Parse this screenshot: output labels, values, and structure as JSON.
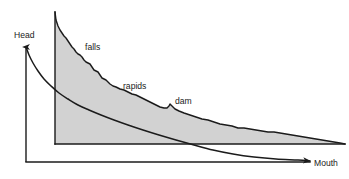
{
  "figure": {
    "kind": "river-longitudinal-profile-diagram",
    "background_color": "#ffffff",
    "stroke_color": "#1b1b1b",
    "fill_color": "#d2d2d2"
  },
  "axes": {
    "head_label": "Head",
    "mouth_label": "Mouth",
    "vertical_axis_name": "elevation-axis",
    "horizontal_axis_name": "distance-axis"
  },
  "annotations": [
    {
      "id": "falls",
      "label": "falls"
    },
    {
      "id": "rapids",
      "label": "rapids"
    },
    {
      "id": "dam",
      "label": "dam"
    }
  ],
  "chart_data": {
    "type": "area",
    "title": "",
    "subtitle": "",
    "xlabel": "Mouth",
    "ylabel": "Head",
    "grid": false,
    "legend": "none",
    "xlim": [
      0,
      349
    ],
    "ylim": [
      0,
      179
    ],
    "axis_note": "Pixel coordinate space of the original 349x179 raster; y increases downward.",
    "series": [
      {
        "name": "irregular river profile (actual long profile with falls, rapids and dam)",
        "type": "area",
        "fill": "#d2d2d2",
        "stroke": "#1b1b1b",
        "baseline_y": 144,
        "points": [
          [
            55,
            12
          ],
          [
            56,
            20
          ],
          [
            58,
            26
          ],
          [
            60,
            30
          ],
          [
            62,
            33
          ],
          [
            64,
            36
          ],
          [
            66,
            38
          ],
          [
            68,
            41
          ],
          [
            70,
            44
          ],
          [
            72,
            47
          ],
          [
            74,
            49
          ],
          [
            76,
            52
          ],
          [
            78,
            54
          ],
          [
            80,
            55
          ],
          [
            82,
            57
          ],
          [
            84,
            60
          ],
          [
            86,
            62
          ],
          [
            88,
            63
          ],
          [
            90,
            64
          ],
          [
            92,
            67
          ],
          [
            94,
            70
          ],
          [
            96,
            71
          ],
          [
            98,
            72
          ],
          [
            100,
            75
          ],
          [
            102,
            78
          ],
          [
            104,
            79
          ],
          [
            106,
            80
          ],
          [
            108,
            82
          ],
          [
            110,
            84
          ],
          [
            113,
            86
          ],
          [
            116,
            87
          ],
          [
            120,
            89
          ],
          [
            124,
            90
          ],
          [
            128,
            92
          ],
          [
            132,
            94
          ],
          [
            136,
            95
          ],
          [
            140,
            97
          ],
          [
            144,
            99
          ],
          [
            148,
            101
          ],
          [
            152,
            103
          ],
          [
            156,
            105
          ],
          [
            160,
            107
          ],
          [
            164,
            108
          ],
          [
            167,
            108
          ],
          [
            169,
            106
          ],
          [
            170,
            104
          ],
          [
            172,
            106
          ],
          [
            175,
            109
          ],
          [
            179,
            111
          ],
          [
            184,
            113
          ],
          [
            190,
            115
          ],
          [
            196,
            117
          ],
          [
            202,
            119
          ],
          [
            208,
            120
          ],
          [
            214,
            122
          ],
          [
            220,
            124
          ],
          [
            226,
            125
          ],
          [
            232,
            126
          ],
          [
            238,
            128
          ],
          [
            244,
            128
          ],
          [
            250,
            129
          ],
          [
            256,
            130
          ],
          [
            262,
            131
          ],
          [
            268,
            132
          ],
          [
            274,
            132
          ],
          [
            280,
            133
          ],
          [
            286,
            134
          ],
          [
            292,
            135
          ],
          [
            298,
            136
          ],
          [
            304,
            137
          ],
          [
            310,
            138
          ],
          [
            316,
            139
          ],
          [
            322,
            140
          ],
          [
            328,
            141
          ],
          [
            334,
            142
          ],
          [
            340,
            143
          ],
          [
            345,
            144
          ]
        ]
      },
      {
        "name": "graded (idealized smooth concave) profile",
        "type": "line",
        "stroke": "#1b1b1b",
        "points": [
          [
            26,
            47
          ],
          [
            29,
            55
          ],
          [
            33,
            63
          ],
          [
            38,
            71
          ],
          [
            44,
            79
          ],
          [
            51,
            86
          ],
          [
            59,
            93
          ],
          [
            68,
            99
          ],
          [
            78,
            105
          ],
          [
            89,
            110
          ],
          [
            101,
            115
          ],
          [
            114,
            120
          ],
          [
            128,
            125
          ],
          [
            143,
            130
          ],
          [
            159,
            135
          ],
          [
            176,
            140
          ],
          [
            194,
            145
          ],
          [
            213,
            150
          ],
          [
            233,
            154
          ],
          [
            254,
            157
          ],
          [
            276,
            159
          ],
          [
            298,
            160
          ],
          [
            310,
            161
          ]
        ]
      }
    ],
    "frame_lines": [
      {
        "name": "vertical-axis-with-arrow",
        "from": [
          26,
          162
        ],
        "to": [
          26,
          47
        ],
        "arrow_at": "to"
      },
      {
        "name": "horizontal-base-axis",
        "from": [
          26,
          162
        ],
        "to": [
          310,
          162
        ],
        "arrow_at": "none"
      },
      {
        "name": "profile-left-edge",
        "from": [
          55,
          12
        ],
        "to": [
          55,
          144
        ],
        "arrow_at": "none"
      },
      {
        "name": "profile-baseline",
        "from": [
          55,
          144
        ],
        "to": [
          345,
          144
        ],
        "arrow_at": "none"
      }
    ],
    "label_positions": [
      {
        "id": "head",
        "text": "Head",
        "x": 14,
        "y": 38
      },
      {
        "id": "falls",
        "text": "falls",
        "x": 85,
        "y": 50
      },
      {
        "id": "rapids",
        "text": "rapids",
        "x": 123,
        "y": 89
      },
      {
        "id": "dam",
        "text": "dam",
        "x": 175,
        "y": 104
      },
      {
        "id": "mouth",
        "text": "Mouth",
        "x": 314,
        "y": 166
      }
    ]
  }
}
